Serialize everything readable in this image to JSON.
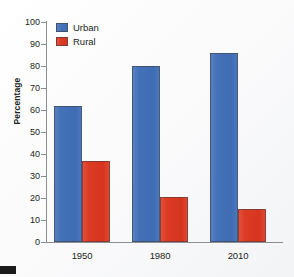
{
  "chart_data": {
    "type": "bar",
    "title": "",
    "subtitle": "",
    "xlabel": "",
    "ylabel": "Percentage",
    "categories": [
      "1950",
      "1980",
      "2010"
    ],
    "series": [
      {
        "name": "Urban",
        "color": "#4472b8",
        "values": [
          62,
          80,
          86
        ]
      },
      {
        "name": "Rural",
        "color": "#dc3b24",
        "values": [
          37,
          20.5,
          15
        ]
      }
    ],
    "ylim": [
      0,
      100
    ],
    "y_ticks": [
      "0",
      "10",
      "20",
      "30",
      "40",
      "50",
      "60",
      "70",
      "80",
      "90",
      "100"
    ],
    "grid": false,
    "legend_position": "top-left",
    "annotations": []
  },
  "axes": {
    "y_title": "Percentage",
    "tick_labels_y": [
      "100",
      "90",
      "80",
      "70",
      "60",
      "50",
      "40",
      "30",
      "20",
      "10",
      "0"
    ],
    "tick_labels_x": [
      "1950",
      "1980",
      "2010"
    ]
  },
  "legend": {
    "items": [
      {
        "label": "Urban",
        "swatch": "urban"
      },
      {
        "label": "Rural",
        "swatch": "rural"
      }
    ]
  }
}
